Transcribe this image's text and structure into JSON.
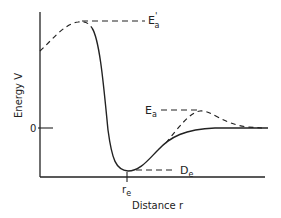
{
  "diagram": {
    "type": "potential-energy-curve",
    "y_axis_label": "Energy V",
    "x_axis_label": "Distance r",
    "zero_tick_label": "0",
    "re_label": "r",
    "re_sub": "e",
    "labels": {
      "Ea_prime": {
        "main": "E",
        "sub": "a",
        "sup": "'"
      },
      "Ea": {
        "main": "E",
        "sub": "a"
      },
      "De": {
        "main": "D",
        "sub": "e"
      }
    },
    "colors": {
      "line": "#222222",
      "background": "#ffffff"
    }
  }
}
